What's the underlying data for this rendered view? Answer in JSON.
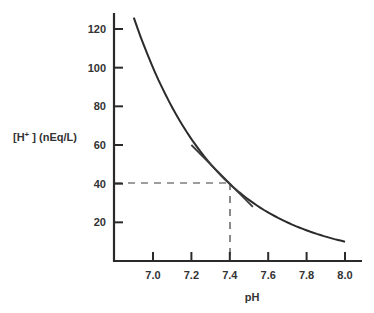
{
  "chart_data": {
    "type": "line",
    "title": "",
    "xlabel": "pH",
    "ylabel": "[H+ ] (nEq/L)",
    "ylabel_parts": {
      "prefix": "[H",
      "sup": "+",
      "suffix": " ] (nEq/L)"
    },
    "xlim": [
      6.8,
      8.08
    ],
    "ylim": [
      0,
      126
    ],
    "x_ticks": [
      7.0,
      7.2,
      7.4,
      7.6,
      7.8,
      8.0
    ],
    "x_tick_labels": [
      "7.0",
      "7.2",
      "7.4",
      "7.6",
      "7.8",
      "8.0"
    ],
    "y_ticks": [
      20,
      40,
      60,
      80,
      100,
      120
    ],
    "y_tick_labels": [
      "20",
      "40",
      "60",
      "80",
      "100",
      "120"
    ],
    "grid": false,
    "legend": null,
    "series": [
      {
        "name": "[H+] vs pH",
        "x": [
          6.9,
          7.0,
          7.1,
          7.2,
          7.3,
          7.4,
          7.5,
          7.6,
          7.7,
          7.8,
          7.9,
          8.0
        ],
        "values": [
          126,
          100,
          79,
          63,
          50,
          40,
          32,
          25,
          20,
          16,
          13,
          10
        ]
      }
    ],
    "annotations": [
      {
        "type": "tangent_line",
        "at": {
          "x": 7.4,
          "y": 40
        },
        "from": {
          "x": 7.2,
          "y": 60
        },
        "to": {
          "x": 7.52,
          "y": 28
        }
      },
      {
        "type": "dashed_guide",
        "description": "horizontal dashed line at y=40 from axis to curve",
        "y": 40,
        "x_range": [
          6.8,
          7.4
        ]
      },
      {
        "type": "dashed_guide",
        "description": "vertical dashed line at x=7.4 from curve to axis",
        "x": 7.4,
        "y_range": [
          0,
          40
        ]
      }
    ]
  }
}
